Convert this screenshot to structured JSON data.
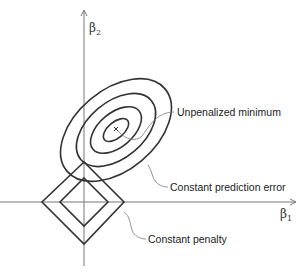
{
  "diagram": {
    "type": "lasso-constraint-illustration",
    "axes": {
      "x_label": "β",
      "x_sub": "1",
      "y_label": "β",
      "y_sub": "2"
    },
    "annotations": {
      "minimum": "Unpenalized minimum",
      "contours": "Constant prediction error",
      "penalty": "Constant penalty"
    },
    "colors": {
      "stroke": "#333333",
      "axis": "#777777",
      "leader": "#888888",
      "background": "#ffffff"
    }
  }
}
